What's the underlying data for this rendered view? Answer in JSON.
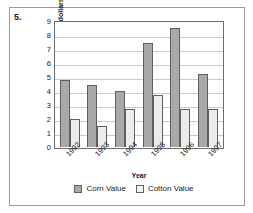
{
  "question_number": "5.",
  "chart_data": {
    "type": "bar",
    "title": "",
    "xlabel": "Year",
    "ylabel": "Value (in billions of dollars)",
    "categories": [
      "1992",
      "1993",
      "1994",
      "1995",
      "1996",
      "1997"
    ],
    "series": [
      {
        "name": "Corn Value",
        "color": "#a9a9a9",
        "values": [
          4.8,
          4.4,
          4.0,
          7.4,
          8.5,
          5.25
        ]
      },
      {
        "name": "Cotton Value",
        "color": "#ececec",
        "values": [
          2.0,
          1.5,
          2.75,
          3.75,
          2.75,
          2.75
        ]
      }
    ],
    "ylim": [
      0,
      9
    ],
    "yticks": [
      0,
      1,
      2,
      3,
      4,
      5,
      6,
      7,
      8,
      9
    ],
    "grid": true,
    "legend_position": "bottom"
  }
}
